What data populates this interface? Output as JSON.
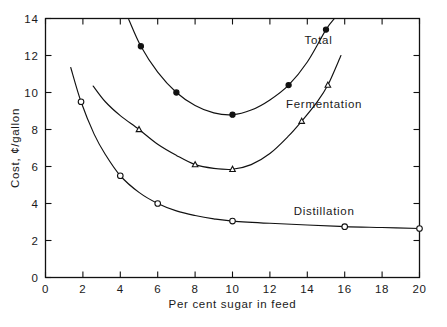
{
  "chart_data": {
    "type": "line",
    "title": "",
    "xlabel": "Per cent sugar in feed",
    "ylabel": "Cost, ¢/gallon",
    "xlim": [
      0,
      20
    ],
    "ylim": [
      0,
      14
    ],
    "xticks": [
      0,
      2,
      4,
      6,
      8,
      10,
      12,
      14,
      16,
      18,
      20
    ],
    "yticks": [
      0,
      2,
      4,
      6,
      8,
      10,
      12,
      14
    ],
    "xticklabels": [
      "0",
      "2",
      "4",
      "6",
      "8",
      "10",
      "12",
      "14",
      "16",
      "18",
      "20"
    ],
    "yticklabels": [
      "0",
      "2",
      "4",
      "6",
      "8",
      "10",
      "12",
      "14"
    ],
    "grid": false,
    "legend": "inline-labels",
    "series": [
      {
        "name": "Total",
        "marker": "filled-circle",
        "label_x": 14.6,
        "label_y": 12.85,
        "x": [
          5.1,
          7.0,
          10.0,
          13.0,
          15.0
        ],
        "y": [
          12.5,
          10.0,
          8.8,
          10.4,
          13.4
        ],
        "curve_x": [
          4.45,
          5.1,
          6.0,
          7.0,
          8.0,
          9.0,
          10.0,
          11.0,
          12.0,
          13.0,
          14.0,
          15.0,
          15.45
        ],
        "curve_y": [
          13.95,
          12.5,
          11.1,
          10.0,
          9.3,
          8.9,
          8.8,
          9.05,
          9.6,
          10.4,
          11.65,
          13.4,
          14.0
        ]
      },
      {
        "name": "Fermentation",
        "marker": "open-triangle",
        "label_x": 14.9,
        "label_y": 9.4,
        "x": [
          5.0,
          8.0,
          10.0,
          13.7,
          15.1
        ],
        "y": [
          8.0,
          6.1,
          5.85,
          8.45,
          10.4
        ],
        "curve_x": [
          2.55,
          3.2,
          4.0,
          5.0,
          6.0,
          7.0,
          8.0,
          9.0,
          10.0,
          11.0,
          12.0,
          13.0,
          13.7,
          14.5,
          15.1,
          15.8
        ],
        "curve_y": [
          10.35,
          9.5,
          8.75,
          8.0,
          7.2,
          6.6,
          6.1,
          5.9,
          5.85,
          6.1,
          6.7,
          7.65,
          8.45,
          9.45,
          10.4,
          12.0
        ]
      },
      {
        "name": "Distillation",
        "marker": "open-circle",
        "label_x": 14.9,
        "label_y": 3.6,
        "x": [
          1.9,
          4.0,
          6.0,
          10.0,
          16.0,
          20.0
        ],
        "y": [
          9.5,
          5.5,
          4.0,
          3.05,
          2.75,
          2.65
        ],
        "curve_x": [
          1.35,
          1.9,
          2.6,
          3.2,
          4.0,
          5.0,
          6.0,
          7.0,
          8.0,
          9.0,
          10.0,
          12.0,
          14.0,
          16.0,
          18.0,
          20.0
        ],
        "curve_y": [
          11.35,
          9.5,
          7.75,
          6.65,
          5.5,
          4.6,
          4.0,
          3.6,
          3.35,
          3.17,
          3.05,
          2.93,
          2.84,
          2.75,
          2.7,
          2.65
        ]
      }
    ]
  }
}
